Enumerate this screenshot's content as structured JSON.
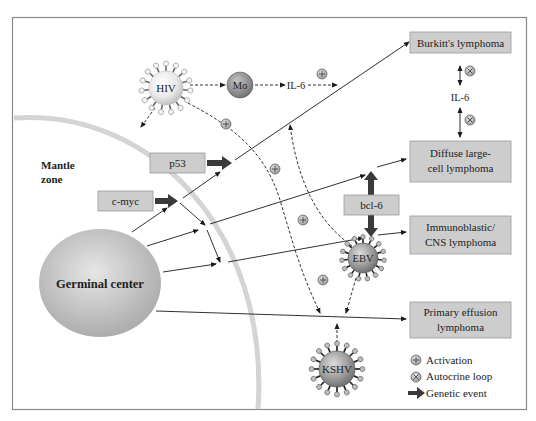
{
  "figure": {
    "regions": {
      "mantle_zone": {
        "line1": "Mantle",
        "line2": "zone"
      },
      "germinal_center": "Germinal center"
    },
    "viruses": {
      "hiv": "HIV",
      "ebv": "EBV",
      "kshv": "KSHV"
    },
    "cells": {
      "monocyte": "Mo"
    },
    "cytokines": {
      "il6_top": "IL-6",
      "il6_right": "IL-6"
    },
    "genes": {
      "p53": "p53",
      "cmyc": "c-myc",
      "bcl6": "bcl-6"
    },
    "lymphomas": {
      "burkitt": {
        "line1": "Burkitt's lymphoma"
      },
      "diffuse": {
        "line1": "Diffuse large-",
        "line2": "cell lymphoma"
      },
      "immunoblastic": {
        "line1": "Immunoblastic/",
        "line2": "CNS lymphoma"
      },
      "primary_effusion": {
        "line1": "Primary effusion",
        "line2": "lymphoma"
      }
    },
    "symbols": {
      "activation": "⊕",
      "autocrine": "⊗"
    },
    "legend": {
      "items": [
        {
          "icon": "activation-icon",
          "label": "Activation"
        },
        {
          "icon": "autocrine-loop-icon",
          "label": "Autocrine loop"
        },
        {
          "icon": "genetic-event-arrow-icon",
          "label": "Genetic event"
        }
      ]
    },
    "colors": {
      "box_fill": "#cdcdcd",
      "arrow_dark": "#3a3a3a",
      "arc": "#d4d4d4",
      "frame": "#8a8a8a"
    }
  }
}
